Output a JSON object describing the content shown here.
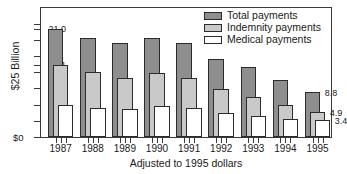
{
  "chart_data": {
    "type": "bar",
    "title": "",
    "subtitle": "",
    "xlabel": "Adjusted to 1995 dollars",
    "ylabel": "$25 Billion",
    "categories": [
      "1987",
      "1988",
      "1989",
      "1990",
      "1991",
      "1992",
      "1993",
      "1994",
      "1995"
    ],
    "series": [
      {
        "name": "Total payments",
        "color": "#8e8e8e",
        "values": [
          21.0,
          19.3,
          18.3,
          19.3,
          18.3,
          15.2,
          13.6,
          11.2,
          8.8
        ]
      },
      {
        "name": "Indemnity payments",
        "color": "#c9c9c9",
        "values": [
          14.1,
          12.7,
          11.6,
          12.4,
          11.6,
          9.4,
          7.9,
          6.2,
          4.9
        ]
      },
      {
        "name": "Medical payments",
        "color": "#ffffff",
        "values": [
          6.3,
          5.6,
          5.5,
          6.0,
          5.6,
          4.7,
          4.1,
          3.6,
          3.4
        ]
      }
    ],
    "ylim": [
      0,
      25.0
    ],
    "yticks": [
      0,
      3.15,
      6.3,
      9.5,
      12.6,
      14.1,
      15.75,
      18.9,
      21.0,
      22.0
    ],
    "ytick_labels": [
      {
        "value": 21.0,
        "text": "21.0"
      },
      {
        "value": 14.1,
        "text": "14.1"
      },
      {
        "value": 6.3,
        "text": "6.3"
      },
      {
        "value": 0,
        "text": "$0"
      }
    ],
    "end_labels": [
      {
        "series": "Total payments",
        "text": "8.8"
      },
      {
        "series": "Indemnity payments",
        "text": "4.9"
      },
      {
        "series": "Medical payments",
        "text": "3.4"
      }
    ],
    "grid": false,
    "legend_position": "top-right",
    "bar_style": "overlapping-offset"
  },
  "legend": {
    "items": [
      {
        "label": "Total payments",
        "swatch": "total"
      },
      {
        "label": "Indemnity payments",
        "swatch": "indemnity"
      },
      {
        "label": "Medical payments",
        "swatch": "medical"
      }
    ]
  },
  "axes": {
    "y_title": "$25 Billion",
    "x_caption": "Adjusted to 1995 dollars",
    "zero_label": "$0"
  },
  "colors": {
    "total": "#8e8e8e",
    "indemnity": "#c9c9c9",
    "medical": "#ffffff",
    "outline": "#2b2b2b",
    "axis": "#3a3a3a",
    "background": "#ffffff"
  }
}
